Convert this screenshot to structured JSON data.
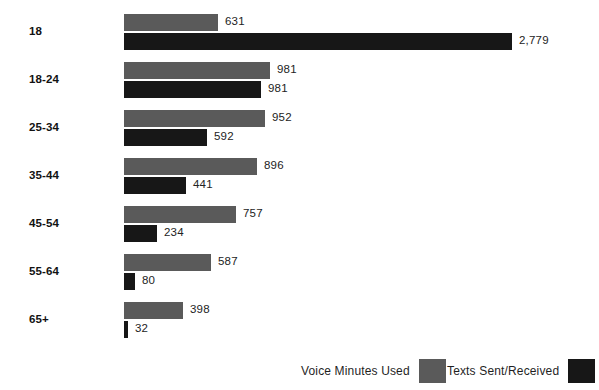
{
  "chart_data": {
    "type": "bar",
    "orientation": "horizontal",
    "title": "",
    "subtitle": "",
    "xlabel": "",
    "ylabel": "",
    "grid": false,
    "legend_position": "bottom-right",
    "categories": [
      "18",
      "18-24",
      "25-34",
      "35-44",
      "45-54",
      "55-64",
      "65+"
    ],
    "series": [
      {
        "name": "Voice Minutes Used",
        "color": "#5a5a5a",
        "values": [
          631,
          981,
          952,
          896,
          757,
          587,
          398
        ],
        "labels": [
          "631",
          "981",
          "952",
          "896",
          "757",
          "587",
          "398"
        ]
      },
      {
        "name": "Texts Sent/Received",
        "color": "#171717",
        "values": [
          2779,
          981,
          592,
          441,
          234,
          80,
          32
        ],
        "labels": [
          "2,779",
          "981",
          "981",
          "441",
          "234",
          "80",
          "32"
        ]
      }
    ],
    "xlim": [
      0,
      2779
    ]
  },
  "rows": [
    {
      "label": "18",
      "voice": {
        "value": 631,
        "label": "631"
      },
      "texts": {
        "value": 2779,
        "label": "2,779"
      }
    },
    {
      "label": "18-24",
      "voice": {
        "value": 981,
        "label": "981"
      },
      "texts": {
        "value": 981,
        "label": "981"
      }
    },
    {
      "label": "25-34",
      "voice": {
        "value": 952,
        "label": "952"
      },
      "texts": {
        "value": 592,
        "label": "592"
      }
    },
    {
      "label": "35-44",
      "voice": {
        "value": 896,
        "label": "896"
      },
      "texts": {
        "value": 441,
        "label": "441"
      }
    },
    {
      "label": "45-54",
      "voice": {
        "value": 757,
        "label": "757"
      },
      "texts": {
        "value": 234,
        "label": "234"
      }
    },
    {
      "label": "55-64",
      "voice": {
        "value": 587,
        "label": "587"
      },
      "texts": {
        "value": 80,
        "label": "80"
      }
    },
    {
      "label": "65+",
      "voice": {
        "value": 398,
        "label": "398"
      },
      "texts": {
        "value": 32,
        "label": "32"
      }
    }
  ],
  "legend": {
    "voice": {
      "label": "Voice Minutes Used",
      "color": "#5a5a5a"
    },
    "texts": {
      "label": "Texts Sent/Received",
      "color": "#171717"
    }
  }
}
